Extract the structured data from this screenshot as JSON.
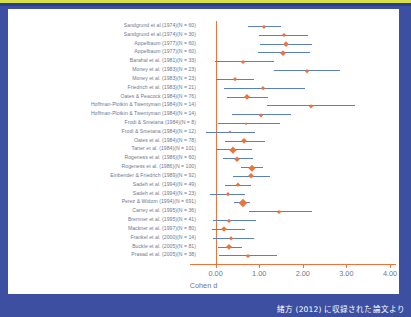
{
  "caption": "緒方 (2012) に収録された論文より",
  "chart_data": {
    "type": "scatter",
    "title": "",
    "xlabel": "Cohen d",
    "ylabel": "",
    "xlim": [
      -0.45,
      4.0
    ],
    "xticks": [
      "0.00",
      "1.00",
      "2.00",
      "3.00",
      "4.00"
    ],
    "xtickvalues": [
      0.0,
      1.0,
      2.0,
      3.0,
      4.0
    ],
    "grid": false,
    "legend": false,
    "reference_line": 0.0,
    "marker_color": "#ef7239",
    "line_color": "#5b7fc4",
    "text_color": "#6a7893",
    "studies": [
      {
        "label": "Sandgrund et al.(1974)(N = 60)",
        "d": 1.12,
        "lo": 0.74,
        "hi": 1.5,
        "size": 3.2
      },
      {
        "label": "Sandgrund et al.(1974)(N = 30)",
        "d": 1.56,
        "lo": 0.99,
        "hi": 2.12,
        "size": 3.0
      },
      {
        "label": "Appelbaum (1977)(N = 60)",
        "d": 1.61,
        "lo": 1.02,
        "hi": 2.21,
        "size": 3.8
      },
      {
        "label": "Appelbaum (1977)(N = 60)",
        "d": 1.54,
        "lo": 0.98,
        "hi": 2.16,
        "size": 3.8
      },
      {
        "label": "Barahal et al. (1981)(N = 33)",
        "d": 0.63,
        "lo": -0.02,
        "hi": 1.33,
        "size": 3.0
      },
      {
        "label": "Money et al. (1983)(N = 23)",
        "d": 2.1,
        "lo": 1.35,
        "hi": 2.85,
        "size": 2.8
      },
      {
        "label": "Money et al. (1983)(N = 23)",
        "d": 0.45,
        "lo": 0.02,
        "hi": 0.89,
        "size": 2.8
      },
      {
        "label": "Friedrich et al. (1983)(N = 21)",
        "d": 1.08,
        "lo": 0.2,
        "hi": 2.04,
        "size": 2.8
      },
      {
        "label": "Oates & Peacock (1984)(N = 76)",
        "d": 0.73,
        "lo": 0.26,
        "hi": 1.2,
        "size": 4.2
      },
      {
        "label": "Hoffman-Plotkin & Twentyman (1984)(N = 14)",
        "d": 2.19,
        "lo": 1.19,
        "hi": 3.2,
        "size": 2.6
      },
      {
        "label": "Hoffman-Plotkin & Twentyman (1984)(N = 14)",
        "d": 1.04,
        "lo": 0.37,
        "hi": 1.73,
        "size": 2.6
      },
      {
        "label": "Frodi & Smetana (1984)(N = 8)",
        "d": 0.7,
        "lo": 0.06,
        "hi": 1.47,
        "size": 2.3
      },
      {
        "label": "Frodi & Smetana (1984)(N = 12)",
        "d": 0.34,
        "lo": -0.23,
        "hi": 0.91,
        "size": 2.3
      },
      {
        "label": "Oates et al. (1984)(N = 78)",
        "d": 0.66,
        "lo": 0.22,
        "hi": 1.13,
        "size": 4.2
      },
      {
        "label": "Tarter et al. (1984)(N = 101)",
        "d": 0.4,
        "lo": 0.01,
        "hi": 0.83,
        "size": 4.8
      },
      {
        "label": "Rogeness et al. (1986)(N = 60)",
        "d": 0.5,
        "lo": 0.18,
        "hi": 0.86,
        "size": 3.6
      },
      {
        "label": "Rogeness et al. (1986)(N = 100)",
        "d": 0.84,
        "lo": 0.59,
        "hi": 1.08,
        "size": 4.6
      },
      {
        "label": "Einbender & Friedrich (1989)(N = 92)",
        "d": 0.82,
        "lo": 0.4,
        "hi": 1.25,
        "size": 4.4
      },
      {
        "label": "Sadeh et al. (1994)(N = 49)",
        "d": 0.51,
        "lo": 0.21,
        "hi": 0.82,
        "size": 3.4
      },
      {
        "label": "Sadeh et al. (1994)(N = 23)",
        "d": 0.28,
        "lo": -0.12,
        "hi": 0.68,
        "size": 2.8
      },
      {
        "label": "Perez & Widom (1994)(N = 691)",
        "d": 0.62,
        "lo": 0.43,
        "hi": 0.8,
        "size": 6.0
      },
      {
        "label": "Carrey et al. (1995)(N = 36)",
        "d": 1.46,
        "lo": 0.77,
        "hi": 2.22,
        "size": 3.0
      },
      {
        "label": "Bremner et al. (1995)(N = 41)",
        "d": 0.31,
        "lo": -0.07,
        "hi": 0.93,
        "size": 3.1
      },
      {
        "label": "Mackner et al. (1997)(N = 80)",
        "d": 0.19,
        "lo": -0.08,
        "hi": 0.68,
        "size": 4.0
      },
      {
        "label": "Frankel et al. (2000)(N = 14)",
        "d": 0.36,
        "lo": -0.06,
        "hi": 0.89,
        "size": 2.6
      },
      {
        "label": "Buckle et al. (2005)(N = 81)",
        "d": 0.31,
        "lo": 0.05,
        "hi": 0.6,
        "size": 4.2
      },
      {
        "label": "Prasad et al. (2005)(N = 38)",
        "d": 0.74,
        "lo": 0.08,
        "hi": 1.41,
        "size": 3.0
      }
    ]
  }
}
